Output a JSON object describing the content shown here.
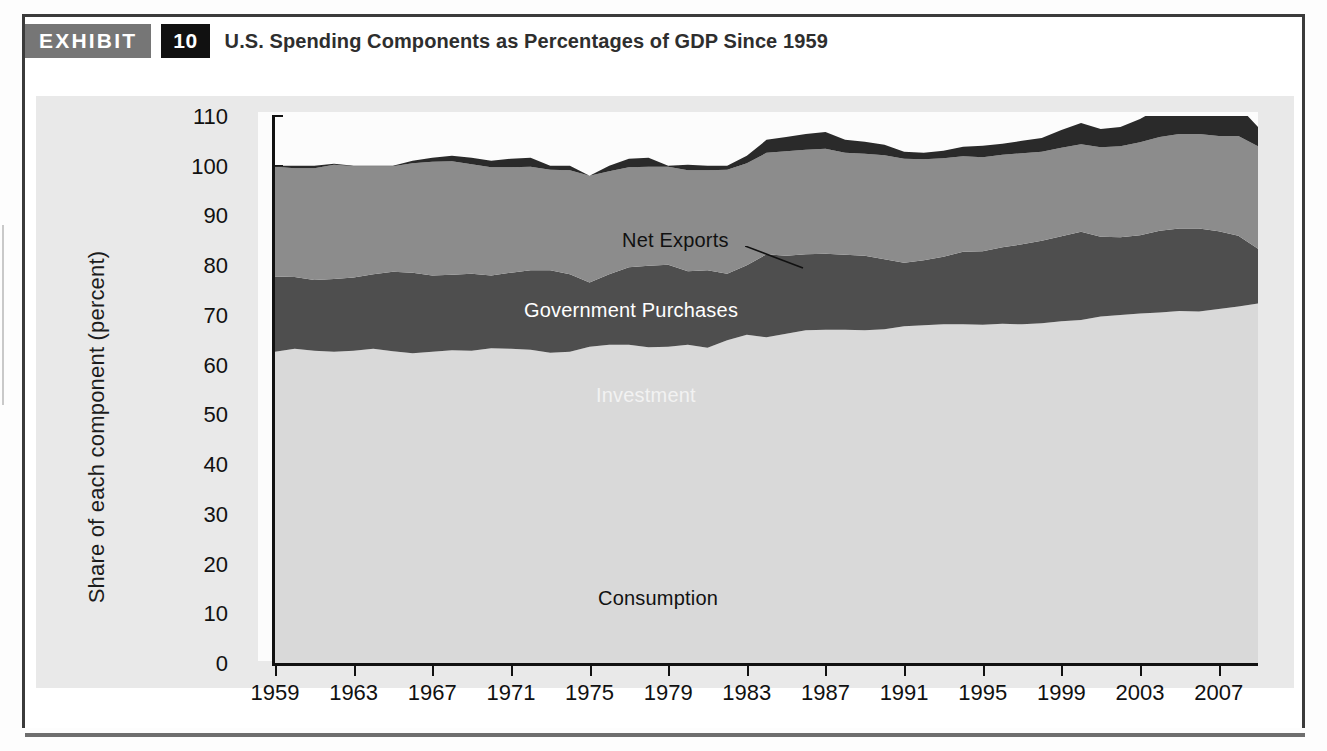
{
  "exhibit": {
    "badge_label": "EXHIBIT",
    "number": "10",
    "title": "U.S. Spending Components as Percentages of GDP Since 1959"
  },
  "chart_data": {
    "type": "area",
    "title": "U.S. Spending Components as Percentages of GDP Since 1959",
    "xlabel": "",
    "ylabel": "Share of each component (percent)",
    "ylim": [
      0,
      110
    ],
    "xlim": [
      1959,
      2009
    ],
    "grid": false,
    "stacked": true,
    "legend_position": "inline-labels",
    "yticks": [
      0,
      10,
      20,
      30,
      40,
      50,
      60,
      70,
      80,
      90,
      100,
      110
    ],
    "xticks": [
      1959,
      1963,
      1967,
      1971,
      1975,
      1979,
      1983,
      1987,
      1991,
      1995,
      1999,
      2003,
      2007
    ],
    "x": [
      1959,
      1960,
      1961,
      1962,
      1963,
      1964,
      1965,
      1966,
      1967,
      1968,
      1969,
      1970,
      1971,
      1972,
      1973,
      1974,
      1975,
      1976,
      1977,
      1978,
      1979,
      1980,
      1981,
      1982,
      1983,
      1984,
      1985,
      1986,
      1987,
      1988,
      1989,
      1990,
      1991,
      1992,
      1993,
      1994,
      1995,
      1996,
      1997,
      1998,
      1999,
      2000,
      2001,
      2002,
      2003,
      2004,
      2005,
      2006,
      2007,
      2008,
      2009
    ],
    "series": [
      {
        "name": "Consumption",
        "color": "#d9d9d9",
        "label_color": "#111111",
        "values": [
          62.6,
          63.2,
          62.8,
          62.6,
          62.8,
          63.2,
          62.7,
          62.3,
          62.6,
          62.9,
          62.8,
          63.3,
          63.2,
          63.0,
          62.4,
          62.6,
          63.6,
          64.0,
          64.0,
          63.5,
          63.6,
          64.0,
          63.4,
          64.9,
          66.0,
          65.5,
          66.2,
          66.9,
          67.0,
          67.0,
          66.9,
          67.1,
          67.7,
          67.9,
          68.1,
          68.1,
          68.0,
          68.2,
          68.1,
          68.3,
          68.7,
          69.0,
          69.7,
          70.0,
          70.3,
          70.5,
          70.8,
          70.7,
          71.2,
          71.7,
          72.3
        ]
      },
      {
        "name": "Investment",
        "color": "#4e4e4e",
        "label_color": "#f2f2f2",
        "values": [
          15.1,
          14.4,
          14.2,
          14.6,
          14.7,
          15.0,
          16.0,
          16.2,
          15.3,
          15.2,
          15.5,
          14.6,
          15.3,
          16.0,
          16.6,
          15.6,
          12.9,
          14.2,
          15.6,
          16.4,
          16.5,
          14.8,
          15.6,
          13.4,
          14.0,
          16.7,
          15.7,
          15.3,
          15.3,
          15.1,
          15.0,
          14.1,
          12.8,
          13.1,
          13.6,
          14.6,
          14.8,
          15.4,
          16.1,
          16.6,
          17.1,
          17.7,
          16.0,
          15.6,
          15.7,
          16.4,
          16.6,
          16.7,
          15.6,
          14.2,
          11.0
        ]
      },
      {
        "name": "Government Purchases",
        "color": "#8c8c8c",
        "label_color": "#ffffff",
        "values": [
          22.1,
          21.9,
          22.5,
          23.0,
          22.4,
          21.7,
          21.2,
          22.0,
          22.9,
          22.8,
          22.0,
          21.8,
          21.2,
          20.8,
          20.2,
          20.9,
          21.5,
          20.7,
          20.1,
          19.9,
          19.7,
          20.3,
          20.1,
          20.9,
          20.5,
          20.4,
          21.0,
          21.0,
          21.1,
          20.5,
          20.5,
          20.9,
          20.9,
          20.3,
          19.8,
          19.2,
          18.9,
          18.6,
          18.3,
          17.9,
          17.8,
          17.6,
          18.0,
          18.3,
          18.7,
          18.9,
          19.0,
          19.0,
          19.2,
          20.1,
          20.6
        ]
      },
      {
        "name": "Net Exports",
        "color": "#2a2a2a",
        "label_color": "#111111",
        "values": [
          0.2,
          0.5,
          0.5,
          0.2,
          0.1,
          0.1,
          0.1,
          0.5,
          0.8,
          1.1,
          1.3,
          1.3,
          1.7,
          1.8,
          0.8,
          0.9,
          0.0,
          1.1,
          1.7,
          1.8,
          0.2,
          1.1,
          0.9,
          0.8,
          1.5,
          2.6,
          2.9,
          3.2,
          3.4,
          2.6,
          2.4,
          2.1,
          1.4,
          1.3,
          1.5,
          1.9,
          2.3,
          2.2,
          2.5,
          2.8,
          3.6,
          4.3,
          3.7,
          3.9,
          4.7,
          5.8,
          6.4,
          6.4,
          6.0,
          6.0,
          3.9
        ]
      }
    ],
    "annotations": [
      {
        "text": "Net Exports",
        "series": "Net Exports"
      },
      {
        "text": "Government Purchases",
        "series": "Government Purchases"
      },
      {
        "text": "Investment",
        "series": "Investment"
      },
      {
        "text": "Consumption",
        "series": "Consumption"
      }
    ],
    "note": "Net Exports band is drawn above the 100 percent line, representing the import share that lifts total spending beyond GDP."
  }
}
